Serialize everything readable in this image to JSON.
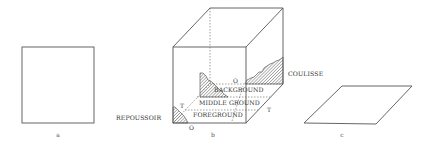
{
  "figure": {
    "panels": [
      {
        "id": "a",
        "caption": "a",
        "shape": "square"
      },
      {
        "id": "b",
        "caption": "b",
        "shape": "cube"
      },
      {
        "id": "c",
        "caption": "c",
        "shape": "parallelogram"
      }
    ],
    "cube_labels": {
      "background": "BACKGROUND",
      "middle_ground": "MIDDLE GROUND",
      "foreground": "FOREGROUND",
      "coulisse": "COULISSE",
      "repoussoir": "REPOUSSOIR"
    },
    "markers": {
      "o_top": "O",
      "o_bottom": "O",
      "t_left": "T",
      "t_right": "T"
    },
    "colors": {
      "line": "#555555",
      "text": "#333333",
      "background": "#ffffff"
    }
  }
}
